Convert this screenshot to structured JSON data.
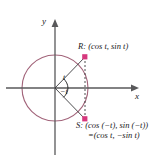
{
  "figure": {
    "type": "unit-circle-diagram",
    "background_color": "#ffffff",
    "axes": {
      "x_label": "x",
      "y_label": "y",
      "axis_color": "#58585a",
      "origin": {
        "x": 55,
        "y": 88
      }
    },
    "circle": {
      "center": {
        "x": 55,
        "y": 88
      },
      "radius": 33,
      "stroke_color": "#a2647a"
    },
    "points": [
      {
        "id": "R",
        "marker_color": "#d6387d",
        "label": "R: (cos t, sin t)",
        "coords": {
          "x": 85,
          "y": 57
        }
      },
      {
        "id": "S",
        "marker_color": "#d6387d",
        "label_line1": "S: (cos (−t), sin (−t))",
        "label_line2": "=(cos t, −sin t)",
        "coords": {
          "x": 85,
          "y": 119
        }
      }
    ],
    "angles": [
      {
        "id": "t",
        "label": "t",
        "sign": "positive"
      },
      {
        "id": "-t",
        "label": "−t",
        "sign": "negative"
      }
    ],
    "segments": {
      "radius_to_r": "solid",
      "radius_to_s": "solid",
      "chord_rs": "dashed",
      "segment_color": "#3a3a3c",
      "dash_color": "#3a3a3c"
    }
  }
}
